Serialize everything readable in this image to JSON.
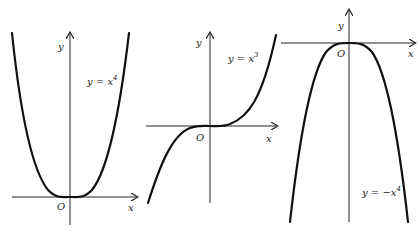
{
  "panels": [
    {
      "id": "quartic",
      "equation_prefix": "y = x",
      "exponent": "4",
      "axis_x_label": "x",
      "axis_y_label": "y",
      "origin_label": "O"
    },
    {
      "id": "cubic",
      "equation_prefix": "y = x",
      "exponent": "3",
      "axis_x_label": "x",
      "axis_y_label": "y",
      "origin_label": "O"
    },
    {
      "id": "neg-quartic",
      "equation_prefix": "y = −x",
      "exponent": "4",
      "axis_x_label": "x",
      "axis_y_label": "y",
      "origin_label": "O"
    }
  ]
}
